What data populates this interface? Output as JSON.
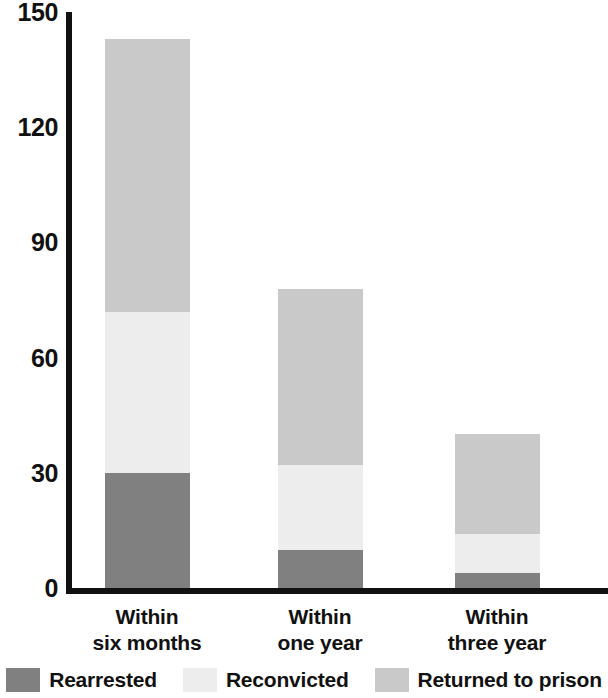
{
  "chart_data": {
    "type": "bar",
    "subtype": "stacked-bar",
    "title": "",
    "xlabel": "",
    "ylabel": "",
    "ylim": [
      0,
      150
    ],
    "yticks": [
      0,
      30,
      60,
      90,
      120,
      150
    ],
    "ytick_labels": [
      "0",
      "30",
      "60",
      "90",
      "120",
      "150"
    ],
    "grid": false,
    "legend_position": "bottom",
    "categories": [
      "Within six months",
      "Within one year",
      "Within three year"
    ],
    "category_lines": [
      [
        "Within",
        "six months"
      ],
      [
        "Within",
        "one year"
      ],
      [
        "Within",
        "three year"
      ]
    ],
    "stacking": "cumulative-overlay",
    "series": [
      {
        "name": "Rearrested",
        "color": "#808080",
        "values": [
          30,
          10,
          4
        ]
      },
      {
        "name": "Reconvicted",
        "color": "#ededed",
        "values": [
          42,
          22,
          10
        ],
        "cumulative_tops": [
          72,
          32,
          14
        ]
      },
      {
        "name": "Returned to prison",
        "color": "#c9c9c9",
        "values": [
          71,
          46,
          26
        ],
        "cumulative_tops": [
          143,
          78,
          40
        ]
      }
    ],
    "bar_totals": [
      143,
      78,
      40
    ],
    "axis_color": "#111111"
  },
  "legend": {
    "items": [
      {
        "label": "Rearrested",
        "color": "#808080"
      },
      {
        "label": "Reconvicted",
        "color": "#ededed"
      },
      {
        "label": "Returned to prison",
        "color": "#c9c9c9"
      }
    ]
  }
}
